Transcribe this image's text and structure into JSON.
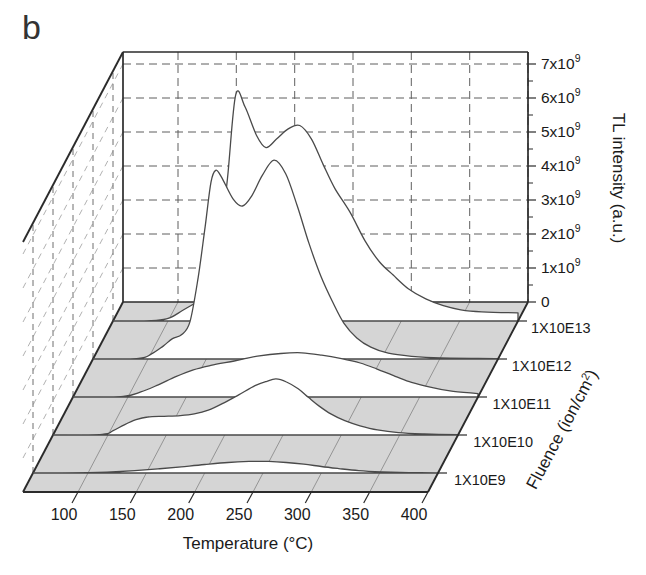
{
  "panel_label": "b",
  "colors": {
    "background": "#ffffff",
    "floor": "#d5d5d5",
    "floor_line": "#8c8c8c",
    "back_grid": "#5f5f5f",
    "wall_vertical": "#6f6f6f",
    "wall_diagonal": "#a8a8a8",
    "curve": "#4a4a4a",
    "curve_fill": "#ffffff",
    "edge": "#2b2b2b",
    "text": "#1a1a1a"
  },
  "chart_data": {
    "type": "line",
    "variant": "3d-waterfall",
    "panel": "b",
    "xlabel": "Temperature (°C)",
    "ylabel": "Fluence (ion/cm^2)",
    "zlabel": "TL intensity (a.u.)",
    "x_ticks": [
      100,
      150,
      200,
      250,
      300,
      350,
      400
    ],
    "x_range": [
      53,
      400
    ],
    "z_ticks": [
      "0",
      "1x10^9",
      "2x10^9",
      "3x10^9",
      "4x10^9",
      "5x10^9",
      "6x10^9",
      "7x10^9"
    ],
    "z_axis_max_1e9": 7.35,
    "grid": true,
    "legend_position": "none",
    "intensity_units": "values in 1e9 a.u.",
    "fluence_labels": [
      "1X10E9",
      "1X10E10",
      "1X10E11",
      "1X10E12",
      "1X10E13"
    ],
    "series": [
      {
        "name": "1X10E9",
        "points": [
          [
            53,
            0
          ],
          [
            100,
            0.01
          ],
          [
            120,
            0.03
          ],
          [
            140,
            0.07
          ],
          [
            160,
            0.12
          ],
          [
            180,
            0.18
          ],
          [
            200,
            0.25
          ],
          [
            220,
            0.31
          ],
          [
            238,
            0.34
          ],
          [
            255,
            0.34
          ],
          [
            270,
            0.31
          ],
          [
            285,
            0.26
          ],
          [
            300,
            0.19
          ],
          [
            315,
            0.13
          ],
          [
            332,
            0.07
          ],
          [
            352,
            0.03
          ],
          [
            375,
            0.01
          ],
          [
            400,
            0.005
          ]
        ]
      },
      {
        "name": "1X10E10",
        "points": [
          [
            53,
            0
          ],
          [
            95,
            0.02
          ],
          [
            104,
            0.12
          ],
          [
            114,
            0.3
          ],
          [
            124,
            0.45
          ],
          [
            134,
            0.53
          ],
          [
            148,
            0.55
          ],
          [
            162,
            0.57
          ],
          [
            174,
            0.62
          ],
          [
            186,
            0.73
          ],
          [
            198,
            0.92
          ],
          [
            212,
            1.18
          ],
          [
            226,
            1.45
          ],
          [
            236,
            1.58
          ],
          [
            244,
            1.65
          ],
          [
            253,
            1.56
          ],
          [
            263,
            1.36
          ],
          [
            272,
            1.1
          ],
          [
            281,
            0.85
          ],
          [
            291,
            0.62
          ],
          [
            303,
            0.42
          ],
          [
            316,
            0.27
          ],
          [
            331,
            0.15
          ],
          [
            349,
            0.07
          ],
          [
            371,
            0.03
          ],
          [
            400,
            0.01
          ]
        ]
      },
      {
        "name": "1X10E11",
        "points": [
          [
            53,
            0
          ],
          [
            96,
            0.02
          ],
          [
            111,
            0.15
          ],
          [
            126,
            0.36
          ],
          [
            141,
            0.6
          ],
          [
            156,
            0.8
          ],
          [
            171,
            0.93
          ],
          [
            191,
            1.06
          ],
          [
            211,
            1.2
          ],
          [
            231,
            1.28
          ],
          [
            249,
            1.3
          ],
          [
            266,
            1.23
          ],
          [
            283,
            1.13
          ],
          [
            299,
            1.0
          ],
          [
            313,
            0.83
          ],
          [
            329,
            0.61
          ],
          [
            343,
            0.43
          ],
          [
            359,
            0.29
          ],
          [
            376,
            0.18
          ],
          [
            400,
            0.1
          ]
        ]
      },
      {
        "name": "1X10E12",
        "points": [
          [
            53,
            0
          ],
          [
            92,
            0.02
          ],
          [
            103,
            0.15
          ],
          [
            113,
            0.38
          ],
          [
            121,
            0.6
          ],
          [
            129,
            0.72
          ],
          [
            136,
            1.1
          ],
          [
            143,
            2.4
          ],
          [
            149,
            3.9
          ],
          [
            154,
            5.2
          ],
          [
            158,
            5.55
          ],
          [
            163,
            5.35
          ],
          [
            173,
            4.7
          ],
          [
            181,
            4.5
          ],
          [
            189,
            4.8
          ],
          [
            198,
            5.4
          ],
          [
            208,
            5.85
          ],
          [
            218,
            5.45
          ],
          [
            228,
            4.5
          ],
          [
            238,
            3.4
          ],
          [
            248,
            2.45
          ],
          [
            258,
            1.7
          ],
          [
            268,
            1.05
          ],
          [
            279,
            0.62
          ],
          [
            291,
            0.35
          ],
          [
            306,
            0.17
          ],
          [
            326,
            0.08
          ],
          [
            351,
            0.03
          ],
          [
            400,
            0.01
          ]
        ]
      },
      {
        "name": "1X10E13",
        "points": [
          [
            53,
            0
          ],
          [
            90,
            0.02
          ],
          [
            102,
            0.1
          ],
          [
            112,
            0.3
          ],
          [
            122,
            0.5
          ],
          [
            130,
            0.65
          ],
          [
            137,
            1.0
          ],
          [
            144,
            2.2
          ],
          [
            151,
            4.2
          ],
          [
            158,
            6.65
          ],
          [
            166,
            6.3
          ],
          [
            176,
            5.45
          ],
          [
            184,
            5.1
          ],
          [
            193,
            5.35
          ],
          [
            203,
            5.65
          ],
          [
            213,
            5.75
          ],
          [
            223,
            5.35
          ],
          [
            233,
            4.6
          ],
          [
            243,
            3.9
          ],
          [
            256,
            3.2
          ],
          [
            269,
            2.35
          ],
          [
            281,
            1.75
          ],
          [
            293,
            1.35
          ],
          [
            306,
            0.95
          ],
          [
            321,
            0.65
          ],
          [
            336,
            0.45
          ],
          [
            351,
            0.33
          ],
          [
            369,
            0.27
          ],
          [
            400,
            0.24
          ]
        ]
      }
    ]
  }
}
